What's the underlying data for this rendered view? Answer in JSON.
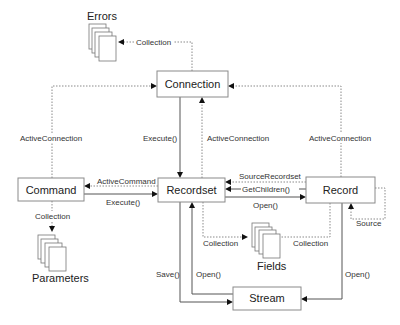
{
  "diagram": {
    "objects": {
      "connection": "Connection",
      "command": "Command",
      "recordset": "Recordset",
      "record": "Record",
      "stream": "Stream"
    },
    "collections": {
      "errors": "Errors",
      "parameters": "Parameters",
      "fields": "Fields"
    },
    "labels": {
      "errors_collection": "Collection",
      "command_active_connection": "ActiveConnection",
      "connection_execute": "Execute()",
      "recordset_active_connection": "ActiveConnection",
      "record_active_connection": "ActiveConnection",
      "active_command": "ActiveCommand",
      "command_execute": "Execute()",
      "source_recordset": "SourceRecordset",
      "get_children": "GetChildren()",
      "record_open": "Open()",
      "parameters_collection": "Collection",
      "recordset_fields_collection": "Collection",
      "record_fields_collection": "Collection",
      "record_source": "Source",
      "save": "Save()",
      "stream_open": "Open()",
      "record_stream_open": "Open()"
    },
    "colors": {
      "box_border": "#8a8a8a",
      "solid_line": "#555555",
      "dotted_line": "#8a8a8a",
      "arrow": "#111111",
      "text": "#222222"
    }
  }
}
